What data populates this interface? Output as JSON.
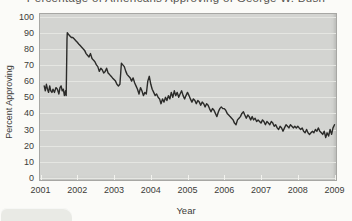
{
  "figure": {
    "clipped_title": "Percentage of Americans Approving of George W. Bush",
    "title_clipped": true
  },
  "chart_data": {
    "type": "line",
    "title": "Percentage of Americans Approving of George W. Bush",
    "xlabel": "Year",
    "ylabel": "Percent Approving",
    "xlim": [
      2001,
      2009
    ],
    "ylim": [
      0,
      100
    ],
    "x_ticks": [
      2001,
      2002,
      2003,
      2004,
      2005,
      2006,
      2007,
      2008,
      2009
    ],
    "y_ticks": [
      0,
      10,
      20,
      30,
      40,
      50,
      60,
      70,
      80,
      90,
      100
    ],
    "grid": "horizontal",
    "legend": "none",
    "colors": {
      "line": "#2b2b29",
      "plot_bg": "#d3d4d1",
      "grid": "#e5e6e2",
      "tick": "#f2f2ee",
      "text": "#3b3b39",
      "border": "#a7a7a4",
      "tab_bg": "#e9eae5",
      "page_bg": "#fbfbf8"
    },
    "series": [
      {
        "name": "percent_approving",
        "color": "#2b2b29",
        "points": [
          [
            2001.1,
            57
          ],
          [
            2001.13,
            54
          ],
          [
            2001.16,
            58
          ],
          [
            2001.19,
            55
          ],
          [
            2001.22,
            53
          ],
          [
            2001.25,
            57
          ],
          [
            2001.28,
            54
          ],
          [
            2001.31,
            53
          ],
          [
            2001.34,
            55
          ],
          [
            2001.38,
            53
          ],
          [
            2001.42,
            56
          ],
          [
            2001.46,
            55
          ],
          [
            2001.5,
            52
          ],
          [
            2001.53,
            56
          ],
          [
            2001.56,
            57
          ],
          [
            2001.59,
            54
          ],
          [
            2001.62,
            55
          ],
          [
            2001.65,
            51
          ],
          [
            2001.68,
            54
          ],
          [
            2001.7,
            51
          ],
          [
            2001.72,
            86
          ],
          [
            2001.73,
            90
          ],
          [
            2001.76,
            89
          ],
          [
            2001.8,
            88
          ],
          [
            2001.84,
            87
          ],
          [
            2001.88,
            87
          ],
          [
            2001.92,
            86
          ],
          [
            2001.96,
            85
          ],
          [
            2002.0,
            84
          ],
          [
            2002.04,
            83
          ],
          [
            2002.08,
            82
          ],
          [
            2002.12,
            81
          ],
          [
            2002.16,
            80
          ],
          [
            2002.2,
            79
          ],
          [
            2002.24,
            77
          ],
          [
            2002.28,
            76
          ],
          [
            2002.32,
            75
          ],
          [
            2002.36,
            77
          ],
          [
            2002.4,
            74
          ],
          [
            2002.44,
            73
          ],
          [
            2002.48,
            72
          ],
          [
            2002.52,
            70
          ],
          [
            2002.56,
            69
          ],
          [
            2002.6,
            66
          ],
          [
            2002.64,
            68
          ],
          [
            2002.68,
            67
          ],
          [
            2002.72,
            65
          ],
          [
            2002.76,
            66
          ],
          [
            2002.8,
            68
          ],
          [
            2002.84,
            65
          ],
          [
            2002.88,
            64
          ],
          [
            2002.92,
            63
          ],
          [
            2002.96,
            62
          ],
          [
            2003.0,
            61
          ],
          [
            2003.04,
            60
          ],
          [
            2003.08,
            58
          ],
          [
            2003.12,
            57
          ],
          [
            2003.16,
            58
          ],
          [
            2003.2,
            71
          ],
          [
            2003.24,
            70
          ],
          [
            2003.28,
            69
          ],
          [
            2003.32,
            66
          ],
          [
            2003.36,
            64
          ],
          [
            2003.4,
            63
          ],
          [
            2003.44,
            62
          ],
          [
            2003.48,
            60
          ],
          [
            2003.52,
            62
          ],
          [
            2003.56,
            59
          ],
          [
            2003.6,
            57
          ],
          [
            2003.64,
            55
          ],
          [
            2003.68,
            52
          ],
          [
            2003.72,
            56
          ],
          [
            2003.76,
            54
          ],
          [
            2003.8,
            51
          ],
          [
            2003.84,
            53
          ],
          [
            2003.88,
            52
          ],
          [
            2003.92,
            60
          ],
          [
            2003.96,
            63
          ],
          [
            2004.0,
            58
          ],
          [
            2004.04,
            55
          ],
          [
            2004.08,
            53
          ],
          [
            2004.12,
            51
          ],
          [
            2004.16,
            52
          ],
          [
            2004.2,
            50
          ],
          [
            2004.24,
            49
          ],
          [
            2004.28,
            46
          ],
          [
            2004.32,
            49
          ],
          [
            2004.36,
            47
          ],
          [
            2004.4,
            50
          ],
          [
            2004.44,
            48
          ],
          [
            2004.48,
            51
          ],
          [
            2004.52,
            49
          ],
          [
            2004.56,
            53
          ],
          [
            2004.6,
            50
          ],
          [
            2004.64,
            54
          ],
          [
            2004.68,
            51
          ],
          [
            2004.72,
            53
          ],
          [
            2004.76,
            50
          ],
          [
            2004.8,
            52
          ],
          [
            2004.84,
            54
          ],
          [
            2004.88,
            51
          ],
          [
            2004.92,
            49
          ],
          [
            2004.96,
            51
          ],
          [
            2005.0,
            53
          ],
          [
            2005.04,
            51
          ],
          [
            2005.08,
            49
          ],
          [
            2005.12,
            47
          ],
          [
            2005.16,
            49
          ],
          [
            2005.2,
            48
          ],
          [
            2005.24,
            46
          ],
          [
            2005.28,
            48
          ],
          [
            2005.32,
            47
          ],
          [
            2005.36,
            45
          ],
          [
            2005.4,
            47
          ],
          [
            2005.44,
            46
          ],
          [
            2005.48,
            44
          ],
          [
            2005.52,
            46
          ],
          [
            2005.56,
            45
          ],
          [
            2005.6,
            43
          ],
          [
            2005.64,
            41
          ],
          [
            2005.68,
            43
          ],
          [
            2005.72,
            42
          ],
          [
            2005.76,
            40
          ],
          [
            2005.8,
            38
          ],
          [
            2005.84,
            41
          ],
          [
            2005.88,
            43
          ],
          [
            2005.92,
            44
          ],
          [
            2005.96,
            43
          ],
          [
            2006.0,
            43
          ],
          [
            2006.04,
            42
          ],
          [
            2006.08,
            40
          ],
          [
            2006.12,
            39
          ],
          [
            2006.16,
            38
          ],
          [
            2006.2,
            37
          ],
          [
            2006.24,
            36
          ],
          [
            2006.28,
            34
          ],
          [
            2006.32,
            33
          ],
          [
            2006.36,
            36
          ],
          [
            2006.4,
            37
          ],
          [
            2006.44,
            38
          ],
          [
            2006.48,
            40
          ],
          [
            2006.52,
            41
          ],
          [
            2006.56,
            39
          ],
          [
            2006.6,
            37
          ],
          [
            2006.64,
            39
          ],
          [
            2006.68,
            38
          ],
          [
            2006.72,
            36
          ],
          [
            2006.76,
            38
          ],
          [
            2006.8,
            36
          ],
          [
            2006.84,
            37
          ],
          [
            2006.88,
            35
          ],
          [
            2006.92,
            36
          ],
          [
            2006.96,
            35
          ],
          [
            2007.0,
            34
          ],
          [
            2007.04,
            36
          ],
          [
            2007.08,
            35
          ],
          [
            2007.12,
            33
          ],
          [
            2007.16,
            35
          ],
          [
            2007.2,
            34
          ],
          [
            2007.24,
            33
          ],
          [
            2007.28,
            35
          ],
          [
            2007.32,
            34
          ],
          [
            2007.36,
            32
          ],
          [
            2007.4,
            33
          ],
          [
            2007.44,
            31
          ],
          [
            2007.48,
            30
          ],
          [
            2007.52,
            32
          ],
          [
            2007.56,
            31
          ],
          [
            2007.6,
            29
          ],
          [
            2007.64,
            31
          ],
          [
            2007.68,
            33
          ],
          [
            2007.72,
            32
          ],
          [
            2007.76,
            31
          ],
          [
            2007.8,
            33
          ],
          [
            2007.84,
            32
          ],
          [
            2007.88,
            31
          ],
          [
            2007.92,
            32
          ],
          [
            2007.96,
            31
          ],
          [
            2008.0,
            32
          ],
          [
            2008.04,
            31
          ],
          [
            2008.08,
            30
          ],
          [
            2008.12,
            31
          ],
          [
            2008.16,
            29
          ],
          [
            2008.2,
            28
          ],
          [
            2008.24,
            30
          ],
          [
            2008.28,
            28
          ],
          [
            2008.32,
            27
          ],
          [
            2008.36,
            28
          ],
          [
            2008.4,
            29
          ],
          [
            2008.44,
            28
          ],
          [
            2008.48,
            30
          ],
          [
            2008.52,
            29
          ],
          [
            2008.56,
            31
          ],
          [
            2008.6,
            29
          ],
          [
            2008.64,
            28
          ],
          [
            2008.68,
            27
          ],
          [
            2008.72,
            29
          ],
          [
            2008.76,
            25
          ],
          [
            2008.8,
            28
          ],
          [
            2008.84,
            26
          ],
          [
            2008.88,
            30
          ],
          [
            2008.92,
            27
          ],
          [
            2008.96,
            31
          ],
          [
            2009.0,
            33
          ]
        ]
      }
    ]
  }
}
